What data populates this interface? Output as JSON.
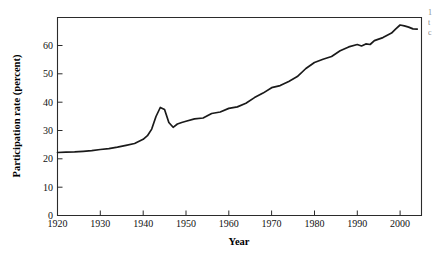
{
  "chart_data": {
    "type": "line",
    "title": "",
    "xlabel": "Year",
    "ylabel": "Participation rate (percent)",
    "xlim": [
      1920,
      2005
    ],
    "ylim": [
      0,
      66
    ],
    "grid": false,
    "legend": null,
    "xticks": [
      1920,
      1930,
      1940,
      1950,
      1960,
      1970,
      1980,
      1990,
      2000
    ],
    "xticklabels": [
      "1920",
      "1930",
      "1940",
      "1950",
      "1960",
      "1970",
      "1980",
      "1990",
      "2000"
    ],
    "yticks": [
      0,
      10,
      20,
      30,
      40,
      50,
      60
    ],
    "yticklabels": [
      "0",
      "10",
      "20",
      "30",
      "40",
      "50",
      "60"
    ],
    "series": [
      {
        "name": "Participation rate",
        "color": "#1a1a1a",
        "x": [
          1920,
          1922,
          1924,
          1926,
          1928,
          1930,
          1932,
          1934,
          1936,
          1938,
          1940,
          1941,
          1942,
          1943,
          1944,
          1945,
          1946,
          1947,
          1948,
          1949,
          1950,
          1952,
          1954,
          1956,
          1958,
          1960,
          1962,
          1964,
          1966,
          1968,
          1970,
          1972,
          1974,
          1976,
          1978,
          1980,
          1982,
          1984,
          1986,
          1988,
          1990,
          1991,
          1992,
          1993,
          1994,
          1996,
          1998,
          1999,
          2000,
          2001,
          2002,
          2003,
          2004
        ],
        "values": [
          21.0,
          21.1,
          21.2,
          21.4,
          21.6,
          22.0,
          22.3,
          22.8,
          23.4,
          24.0,
          25.4,
          26.6,
          28.8,
          33.0,
          36.0,
          35.3,
          31.0,
          29.4,
          30.5,
          31.0,
          31.4,
          32.2,
          32.5,
          34.0,
          34.5,
          35.7,
          36.2,
          37.4,
          39.3,
          40.8,
          42.6,
          43.3,
          44.7,
          46.3,
          49.0,
          51.0,
          52.1,
          53.0,
          54.9,
          56.2,
          57.0,
          56.5,
          57.2,
          57.0,
          58.3,
          59.3,
          60.8,
          62.2,
          63.5,
          63.2,
          62.8,
          62.2,
          62.1
        ]
      }
    ],
    "annotations": {
      "wwii_spike_year": 1944,
      "wwii_spike_value": 36.0,
      "peak_year": 2000,
      "peak_value": 63.5
    }
  },
  "axes": {
    "x_title": "Year",
    "y_title": "Participation rate (percent)"
  },
  "edge_text": {
    "cropped_caption_lines": [
      "1",
      "t",
      "c"
    ]
  }
}
